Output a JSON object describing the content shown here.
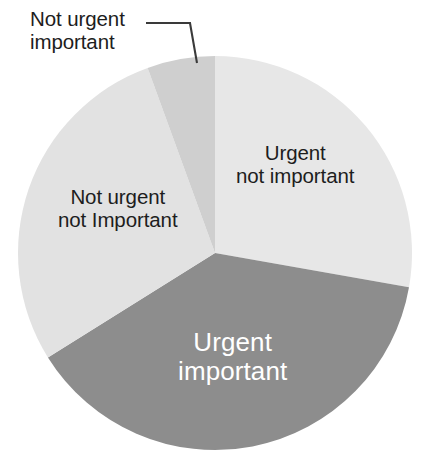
{
  "chart_data": {
    "type": "pie",
    "title": "",
    "subtitle": "",
    "xlabel": "",
    "ylabel": "",
    "legend_position": "none",
    "grid": false,
    "labels_inside": true,
    "categories": [
      "Urgent not important",
      "Urgent important",
      "Not urgent not Important",
      "Not urgent important"
    ],
    "values": [
      28,
      38,
      28,
      6
    ],
    "units": "percent",
    "slices": [
      {
        "name": "Urgent not important",
        "line1": "Urgent",
        "line2": "not important",
        "value": 28,
        "start_angle_deg": 0,
        "end_angle_deg": 100,
        "color": "#e7e7e7",
        "label_color": "#1d1d1d",
        "label_placement": "inside"
      },
      {
        "name": "Urgent important",
        "line1": "Urgent",
        "line2": "important",
        "value": 38,
        "start_angle_deg": 100,
        "end_angle_deg": 238,
        "color": "#8d8d8d",
        "label_color": "#ffffff",
        "label_placement": "inside"
      },
      {
        "name": "Not urgent not Important",
        "line1": "Not urgent",
        "line2": "not Important",
        "value": 28,
        "start_angle_deg": 238,
        "end_angle_deg": 340,
        "color": "#e2e2e2",
        "label_color": "#1d1d1d",
        "label_placement": "inside"
      },
      {
        "name": "Not urgent important",
        "line1": "Not urgent",
        "line2": "important",
        "value": 6,
        "start_angle_deg": 340,
        "end_angle_deg": 360,
        "color": "#cfcfcf",
        "label_color": "#1d1d1d",
        "label_placement": "callout"
      }
    ],
    "colors": {
      "urgent_not_important": "#e7e7e7",
      "urgent_important": "#8d8d8d",
      "not_urgent_not_important": "#e2e2e2",
      "not_urgent_important": "#cfcfcf",
      "leader_line": "#3a3a3a",
      "text_dark": "#1d1d1d",
      "text_light": "#ffffff",
      "background": "#ffffff"
    }
  },
  "chart": {
    "callout": {
      "line1": "Not urgent",
      "line2": "important"
    },
    "slice_right": {
      "line1": "Urgent",
      "line2": "not important"
    },
    "slice_left": {
      "line1": "Not urgent",
      "line2": "not Important"
    },
    "slice_bottom": {
      "line1": "Urgent",
      "line2": "important"
    }
  }
}
